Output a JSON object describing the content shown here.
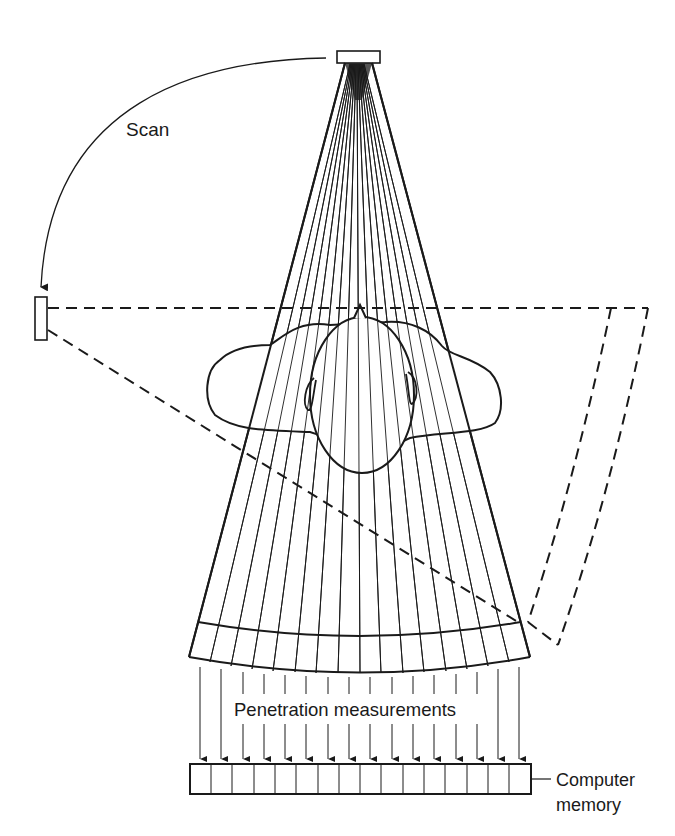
{
  "diagram": {
    "type": "CT scanner fan-beam schematic",
    "labels": {
      "scan": "Scan",
      "penetration": "Penetration measurements",
      "memory_line1": "Computer",
      "memory_line2": "memory"
    },
    "elements": {
      "source": "x-ray source",
      "detector_start": "detector at scan start position",
      "fan_rays_count": 16,
      "arrow_count": 16,
      "memory_cells": 16
    },
    "colors": {
      "ink": "#1a1a1a",
      "background": "#ffffff"
    }
  }
}
